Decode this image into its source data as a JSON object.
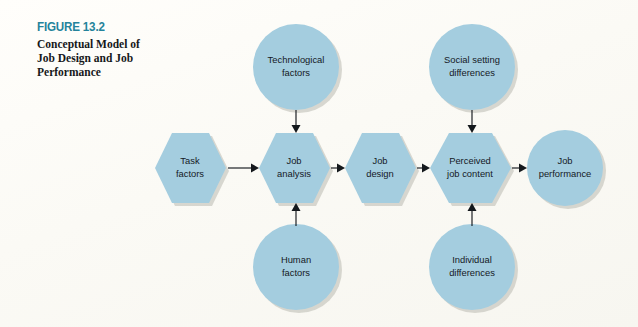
{
  "figure": {
    "number": "FIGURE 13.2",
    "caption": "Conceptual Model of Job Design and Job Performance",
    "accent_color": "#24839b",
    "node_fill": "#a4cddf",
    "connector_color": "#14181c",
    "background_color": "#fdfcf8"
  },
  "diagram": {
    "type": "flow-diagram",
    "nodes": [
      {
        "id": "task-factors",
        "shape": "hexagon",
        "lines": [
          "Task",
          "factors"
        ],
        "row": "main",
        "order": 1
      },
      {
        "id": "job-analysis",
        "shape": "hexagon",
        "lines": [
          "Job",
          "analysis"
        ],
        "row": "main",
        "order": 2
      },
      {
        "id": "job-design",
        "shape": "hexagon",
        "lines": [
          "Job",
          "design"
        ],
        "row": "main",
        "order": 3
      },
      {
        "id": "perceived-job-content",
        "shape": "hexagon",
        "lines": [
          "Perceived",
          "job content"
        ],
        "row": "main",
        "order": 4
      },
      {
        "id": "job-performance",
        "shape": "circle",
        "lines": [
          "Job",
          "performance"
        ],
        "row": "main",
        "order": 5
      },
      {
        "id": "technological-factors",
        "shape": "circle",
        "lines": [
          "Technological",
          "factors"
        ],
        "row": "top",
        "order": 1
      },
      {
        "id": "social-setting-differences",
        "shape": "circle",
        "lines": [
          "Social setting",
          "differences"
        ],
        "row": "top",
        "order": 2
      },
      {
        "id": "human-factors",
        "shape": "circle",
        "lines": [
          "Human",
          "factors"
        ],
        "row": "bottom",
        "order": 1
      },
      {
        "id": "individual-differences",
        "shape": "circle",
        "lines": [
          "Individual",
          "differences"
        ],
        "row": "bottom",
        "order": 2
      }
    ],
    "edges": [
      {
        "from": "task-factors",
        "to": "job-analysis",
        "direction": "right"
      },
      {
        "from": "job-analysis",
        "to": "job-design",
        "direction": "right"
      },
      {
        "from": "job-design",
        "to": "perceived-job-content",
        "direction": "right"
      },
      {
        "from": "perceived-job-content",
        "to": "job-performance",
        "direction": "right"
      },
      {
        "from": "technological-factors",
        "to": "job-analysis",
        "direction": "down"
      },
      {
        "from": "human-factors",
        "to": "job-analysis",
        "direction": "up"
      },
      {
        "from": "social-setting-differences",
        "to": "perceived-job-content",
        "direction": "down"
      },
      {
        "from": "individual-differences",
        "to": "perceived-job-content",
        "direction": "up"
      }
    ]
  }
}
